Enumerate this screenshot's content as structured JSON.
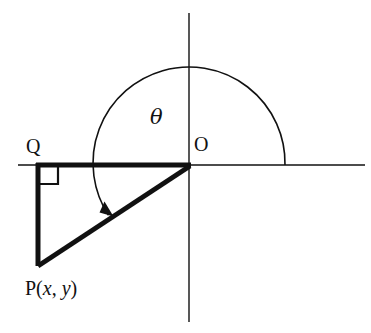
{
  "figure": {
    "background_color": "#ffffff",
    "stroke_color": "#111111",
    "width": 371,
    "height": 333
  },
  "labels": {
    "origin": "O",
    "foot": "Q",
    "angle": "θ",
    "point_prefix": "P(",
    "point_x": "x",
    "point_comma": ", ",
    "point_y": "y",
    "point_suffix": ")"
  },
  "axes": {
    "x_axis": {
      "name": "x-axis",
      "x1": 18,
      "y1": 165,
      "x2": 365,
      "y2": 165,
      "stroke_width": 1.4
    },
    "y_axis": {
      "name": "y-axis",
      "x1": 189,
      "y1": 13,
      "x2": 189,
      "y2": 322,
      "stroke_width": 1.4
    }
  },
  "points": {
    "O": {
      "x": 189,
      "y": 165
    },
    "Q": {
      "x": 38,
      "y": 165
    },
    "P": {
      "x": 38,
      "y": 265
    }
  },
  "triangle": {
    "name": "right-triangle-OQP",
    "stroke_width": 5,
    "segments": [
      {
        "name": "segment-QO",
        "x1": 38,
        "y1": 165,
        "x2": 189,
        "y2": 165
      },
      {
        "name": "segment-QP",
        "x1": 38,
        "y1": 165,
        "x2": 38,
        "y2": 265
      },
      {
        "name": "segment-OP",
        "x1": 189,
        "y1": 165,
        "x2": 38,
        "y2": 265
      }
    ]
  },
  "right_angle_marker": {
    "name": "right-angle-at-Q",
    "path": "M 38 185 L 58 185 L 58 165",
    "stroke_width": 2.2
  },
  "angle_arc": {
    "name": "angle-arc-theta",
    "center_x": 189,
    "center_y": 165,
    "radius": 96,
    "start_angle_deg": 0,
    "end_angle_deg": 213,
    "stroke_width": 1.6,
    "direction": "counterclockwise",
    "arrowhead": {
      "x": 108,
      "y": 209
    }
  }
}
